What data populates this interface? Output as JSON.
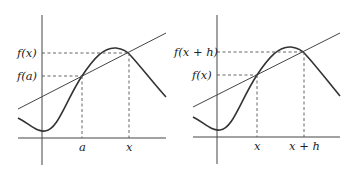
{
  "panels": [
    {
      "id": "left",
      "x_labels": {
        "first": "a",
        "second": "x"
      },
      "y_labels": {
        "first": "f(a)",
        "second": "f(x)"
      },
      "description": "Secant line through (a, f(a)) and (x, f(x))"
    },
    {
      "id": "right",
      "x_labels": {
        "first": "x",
        "second": "x + h"
      },
      "y_labels": {
        "first": "f(x)",
        "second": "f(x + h)"
      },
      "description": "Secant line through (x, f(x)) and (x + h, f(x + h))"
    }
  ],
  "colors": {
    "ink": "#333333",
    "background": "#ffffff"
  }
}
